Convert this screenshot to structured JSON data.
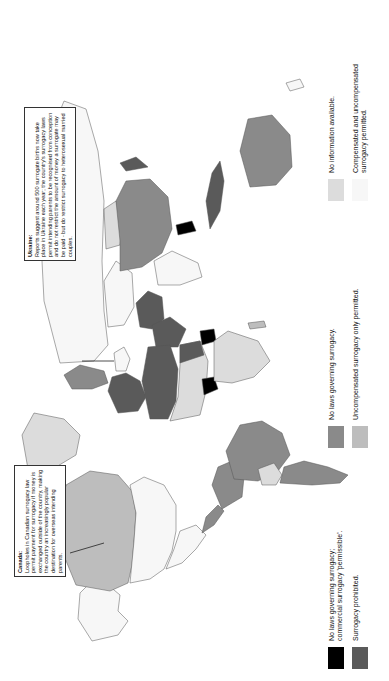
{
  "figure": {
    "orientation": "rotated-90-ccw",
    "colors": {
      "commercial_permissible": "#000000",
      "prohibited": "#5a5a5a",
      "no_laws": "#8a8a8a",
      "uncompensated_only": "#bdbdbd",
      "no_information": "#dcdcdc",
      "compensated_and_uncompensated": "#f7f7f7",
      "border": "#555555"
    }
  },
  "legend": {
    "items": [
      {
        "key": "commercial_permissible",
        "label": "No laws governing surrogacy;\ncommercial surrogacy 'permissible'.",
        "color": "#000000"
      },
      {
        "key": "prohibited",
        "label": "Surrogacy prohibited.",
        "color": "#5a5a5a"
      },
      {
        "key": "no_laws",
        "label": "No laws governing surrogacy.",
        "color": "#8a8a8a"
      },
      {
        "key": "uncompensated_only",
        "label": "Uncompensated surrogacy only permitted.",
        "color": "#bdbdbd"
      },
      {
        "key": "no_information",
        "label": "No information available.",
        "color": "#dcdcdc"
      },
      {
        "key": "compensated_and_uncompensated",
        "label": "Compensated and uncompensated\nsurrogacy permitted.",
        "color": "#f7f7f7"
      }
    ]
  },
  "callouts": {
    "canada": {
      "title": "Canada:",
      "text": "Loopholes in Canadian surrogacy law permit payment for surrogacy if money is exchanged outside of the country, making the country an increasingly popular destination for overseas intending parents."
    },
    "ukraine": {
      "title": "Ukraine:",
      "text": "Reports suggest around 500 surrogate births now take place in Ukraine each year; the country's surrogacy laws permit intending parents to be recognised from conception and do not restrict the amount of money a surrogate may be paid - but do restrict surrogacy to heterosexual married couples."
    }
  },
  "regions": [
    {
      "name": "Alaska",
      "category": "compensated_and_uncompensated"
    },
    {
      "name": "Canada",
      "category": "uncompensated_only"
    },
    {
      "name": "United States",
      "category": "compensated_and_uncompensated"
    },
    {
      "name": "Greenland",
      "category": "no_information"
    },
    {
      "name": "Mexico",
      "category": "compensated_and_uncompensated"
    },
    {
      "name": "Central America",
      "category": "no_laws"
    },
    {
      "name": "Colombia/Venezuela",
      "category": "no_laws"
    },
    {
      "name": "Brazil",
      "category": "no_laws"
    },
    {
      "name": "Bolivia",
      "category": "no_information"
    },
    {
      "name": "Argentina",
      "category": "no_laws"
    },
    {
      "name": "Western Europe",
      "category": "prohibited"
    },
    {
      "name": "Ukraine",
      "category": "compensated_and_uncompensated"
    },
    {
      "name": "Russia",
      "category": "compensated_and_uncompensated"
    },
    {
      "name": "North Africa",
      "category": "prohibited"
    },
    {
      "name": "Sahel countries",
      "category": "no_information"
    },
    {
      "name": "Nigeria",
      "category": "commercial_permissible"
    },
    {
      "name": "Sudan",
      "category": "prohibited"
    },
    {
      "name": "Ethiopia",
      "category": "commercial_permissible"
    },
    {
      "name": "Southern Africa",
      "category": "no_information"
    },
    {
      "name": "Saudi Arabia",
      "category": "prohibited"
    },
    {
      "name": "Iran",
      "category": "prohibited"
    },
    {
      "name": "Kazakhstan",
      "category": "compensated_and_uncompensated"
    },
    {
      "name": "India",
      "category": "compensated_and_uncompensated"
    },
    {
      "name": "China",
      "category": "no_laws"
    },
    {
      "name": "Mongolia",
      "category": "no_information"
    },
    {
      "name": "Thailand",
      "category": "commercial_permissible"
    },
    {
      "name": "Indonesia",
      "category": "prohibited"
    },
    {
      "name": "Japan",
      "category": "prohibited"
    },
    {
      "name": "Australia",
      "category": "no_laws"
    }
  ]
}
